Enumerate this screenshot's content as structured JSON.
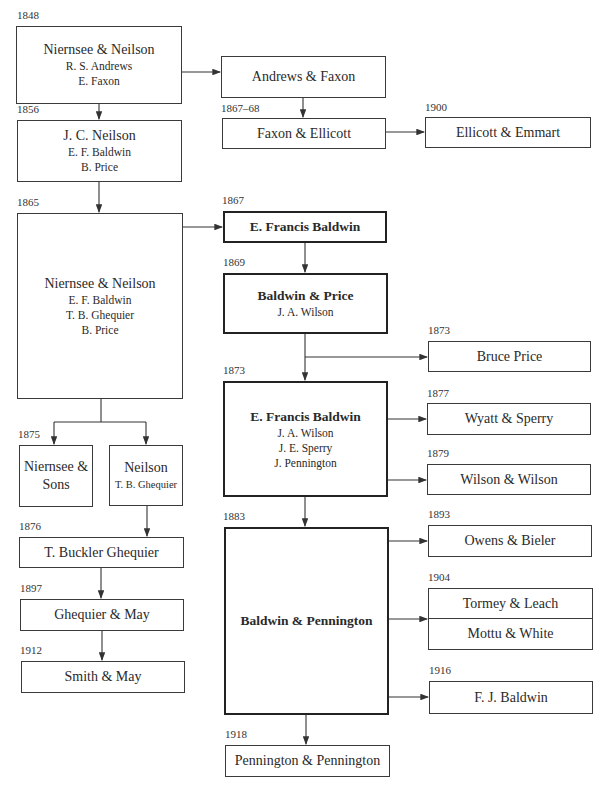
{
  "diagram": {
    "nodes": {
      "n1848": {
        "year": "1848",
        "title": "Niernsee & Neilson",
        "members": [
          "R. S. Andrews",
          "E. Faxon"
        ]
      },
      "andrews_faxon": {
        "title": "Andrews & Faxon"
      },
      "faxon_ellicott": {
        "year": "1867–68",
        "title": "Faxon & Ellicott"
      },
      "ellicott_emmart": {
        "year": "1900",
        "title": "Ellicott & Emmart"
      },
      "n1856": {
        "year": "1856",
        "title": "J. C. Neilson",
        "members": [
          "E. F. Baldwin",
          "B. Price"
        ]
      },
      "n1865": {
        "year": "1865",
        "title": "Niernsee & Neilson",
        "members": [
          "E. F. Baldwin",
          "T. B. Ghequier",
          "B. Price"
        ]
      },
      "efb1867": {
        "year": "1867",
        "title": "E. Francis Baldwin"
      },
      "baldwin_price": {
        "year": "1869",
        "title": "Baldwin & Price",
        "members": [
          "J. A. Wilson"
        ]
      },
      "bruce_price": {
        "year": "1873",
        "title": "Bruce Price"
      },
      "efb1873": {
        "year": "1873",
        "title": "E. Francis Baldwin",
        "members": [
          "J. A. Wilson",
          "J. E. Sperry",
          "J. Pennington"
        ]
      },
      "wyatt_sperry": {
        "year": "1877",
        "title": "Wyatt & Sperry"
      },
      "wilson_wilson": {
        "year": "1879",
        "title": "Wilson & Wilson"
      },
      "niernsee_sons": {
        "year": "1875",
        "title_line1": "Niernsee &",
        "title_line2": "Sons"
      },
      "neilson1875": {
        "title": "Neilson",
        "members": [
          "T. B. Ghequier"
        ]
      },
      "tbg": {
        "year": "1876",
        "title": "T. Buckler Ghequier"
      },
      "ghequier_may": {
        "year": "1897",
        "title": "Ghequier & May"
      },
      "smith_may": {
        "year": "1912",
        "title": "Smith & May"
      },
      "baldwin_pennington": {
        "year": "1883",
        "title": "Baldwin & Pennington"
      },
      "owens_bieler": {
        "year": "1893",
        "title": "Owens & Bieler"
      },
      "tormey_mottu": {
        "year": "1904",
        "top": "Tormey & Leach",
        "bottom": "Mottu & White"
      },
      "fj_baldwin": {
        "year": "1916",
        "title": "F. J. Baldwin"
      },
      "pennington_pennington": {
        "year": "1918",
        "title": "Pennington & Pennington"
      }
    }
  }
}
